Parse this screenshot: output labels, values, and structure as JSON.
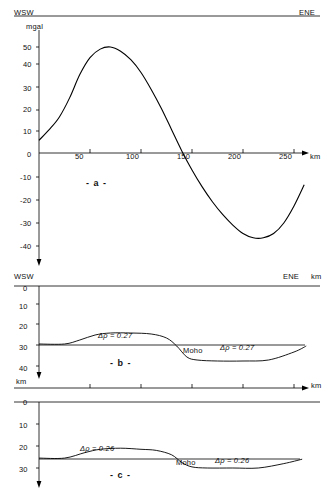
{
  "figure": {
    "direction_left": "WSW",
    "direction_right": "ENE",
    "panel_a_label": "- a -",
    "panel_b_label": "- b -",
    "panel_c_label": "- c -"
  },
  "panel_a": {
    "unit_label": "mgal",
    "axis_unit_right": "km",
    "y_ticks": [
      "50",
      "40",
      "30",
      "20",
      "10",
      "0",
      "-10",
      "-20",
      "-30",
      "-40"
    ],
    "x_ticks": [
      "50",
      "100",
      "150",
      "200",
      "250"
    ]
  },
  "panel_b": {
    "direction_left": "WSW",
    "direction_right": "ENE",
    "axis_unit_right": "km",
    "depth_unit": "km",
    "y_ticks": [
      "0",
      "10",
      "20",
      "30",
      "40"
    ],
    "annotation_left": "Δρ = 0.27",
    "annotation_right": "Δρ = 0.27",
    "moho_label": "Moho"
  },
  "panel_c": {
    "depth_unit": "km",
    "axis_unit_right": "km",
    "y_ticks": [
      "0",
      "10",
      "20",
      "30"
    ],
    "annotation_left": "Δρ = 0.26",
    "annotation_right": "Δρ = 0.26",
    "moho_label": "Moho"
  },
  "chart_data": {
    "type": "line",
    "title": "",
    "panels": [
      {
        "id": "a",
        "ylabel": "mgal",
        "xlabel": "km",
        "xlim": [
          0,
          265
        ],
        "ylim": [
          -45,
          55
        ],
        "x_ticks": [
          50,
          100,
          150,
          200,
          250
        ],
        "y_ticks": [
          50,
          40,
          30,
          20,
          10,
          0,
          -10,
          -20,
          -30,
          -40
        ],
        "grid": false,
        "series": [
          {
            "name": "Bouguer anomaly",
            "x": [
              0,
              10,
              20,
              30,
              40,
              50,
              60,
              70,
              80,
              90,
              100,
              110,
              120,
              130,
              140,
              150,
              160,
              170,
              180,
              190,
              200,
              210,
              220,
              230,
              240,
              250,
              260
            ],
            "y": [
              6,
              11,
              17,
              26,
              37,
              45,
              49,
              50,
              48,
              44,
              38,
              30,
              21,
              11,
              1,
              -8,
              -16,
              -23,
              -29,
              -34,
              -38,
              -40,
              -40,
              -38,
              -33,
              -25,
              -15
            ]
          }
        ]
      },
      {
        "id": "b",
        "ylabel": "km",
        "xlabel": "km",
        "xlim": [
          0,
          265
        ],
        "ylim": [
          45,
          0
        ],
        "y_ticks": [
          0,
          10,
          20,
          30,
          40
        ],
        "annotations": [
          "Δρ = 0.27",
          "Δρ = 0.27",
          "Moho"
        ],
        "series": [
          {
            "name": "Moho depth model b",
            "x": [
              0,
              25,
              40,
              55,
              70,
              90,
              110,
              125,
              135,
              145,
              155,
              175,
              200,
              225,
              250,
              262
            ],
            "y": [
              29,
              29,
              27,
              24.5,
              23.5,
              23.5,
              24,
              26,
              30,
              35.5,
              37,
              37.5,
              37.5,
              37,
              33,
              30
            ]
          },
          {
            "name": "reference level 30 km",
            "x": [
              0,
              262
            ],
            "y": [
              30,
              30
            ]
          }
        ]
      },
      {
        "id": "c",
        "ylabel": "km",
        "xlabel": "km",
        "xlim": [
          0,
          265
        ],
        "ylim": [
          35,
          0
        ],
        "y_ticks": [
          0,
          10,
          20,
          30
        ],
        "annotations": [
          "Δρ = 0.26",
          "Δρ = 0.26",
          "Moho"
        ],
        "series": [
          {
            "name": "Moho depth model c",
            "x": [
              0,
              25,
              45,
              60,
              80,
              100,
              115,
              130,
              140,
              150,
              165,
              190,
              215,
              240,
              258
            ],
            "y": [
              25.5,
              25.5,
              23,
              21.5,
              21,
              21.5,
              22,
              24,
              27.5,
              29.5,
              30,
              30,
              30,
              28,
              26
            ]
          },
          {
            "name": "reference level 26 km",
            "x": [
              0,
              258
            ],
            "y": [
              26
            ]
          }
        ]
      }
    ]
  }
}
